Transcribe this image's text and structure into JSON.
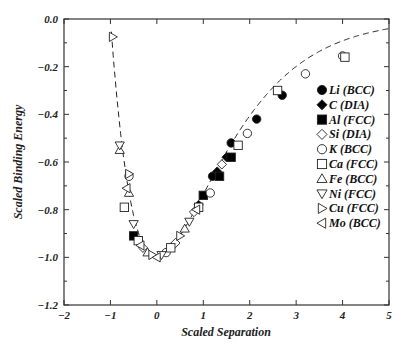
{
  "chart_data": {
    "type": "scatter",
    "title": "",
    "xlabel": "Scaled Separation",
    "ylabel": "Scaled Binding Energy",
    "xlim": [
      -2,
      5
    ],
    "ylim": [
      -1.2,
      0.0
    ],
    "xticks": [
      "-2",
      "-1",
      "0",
      "1",
      "2",
      "3",
      "4",
      "5"
    ],
    "yticks": [
      "0.0",
      "-0.2",
      "-0.4",
      "-0.6",
      "-0.8",
      "-1.0",
      "-1.2"
    ],
    "grid": false,
    "legend_position": "right-inside",
    "curve": {
      "name": "Universal binding energy relation",
      "style": "dashed",
      "formula": "E* = -(1 + a*) exp(-a*)"
    },
    "series": [
      {
        "name": "Li (BCC)",
        "marker": "filled-circle",
        "points": [
          [
            1.2,
            -0.66
          ],
          [
            1.6,
            -0.52
          ],
          [
            2.15,
            -0.42
          ],
          [
            2.7,
            -0.32
          ]
        ]
      },
      {
        "name": "C (DIA)",
        "marker": "filled-diamond",
        "points": [
          [
            0.9,
            -0.78
          ],
          [
            1.3,
            -0.64
          ],
          [
            1.5,
            -0.58
          ]
        ]
      },
      {
        "name": "Al (FCC)",
        "marker": "filled-square",
        "points": [
          [
            -0.5,
            -0.91
          ],
          [
            1.0,
            -0.74
          ],
          [
            1.35,
            -0.66
          ],
          [
            1.6,
            -0.58
          ]
        ]
      },
      {
        "name": "Si (DIA)",
        "marker": "open-diamond",
        "points": [
          [
            -0.3,
            -0.96
          ],
          [
            0.4,
            -0.94
          ],
          [
            0.8,
            -0.81
          ],
          [
            1.4,
            -0.61
          ]
        ]
      },
      {
        "name": "K (BCC)",
        "marker": "open-circle",
        "points": [
          [
            -0.6,
            -0.66
          ],
          [
            0.2,
            -0.98
          ],
          [
            1.15,
            -0.73
          ],
          [
            1.95,
            -0.48
          ],
          [
            3.2,
            -0.23
          ],
          [
            4.0,
            -0.155
          ]
        ]
      },
      {
        "name": "Ca (FCC)",
        "marker": "open-square",
        "points": [
          [
            -0.7,
            -0.79
          ],
          [
            -0.4,
            -0.93
          ],
          [
            0.3,
            -0.96
          ],
          [
            0.9,
            -0.79
          ],
          [
            1.75,
            -0.53
          ],
          [
            2.6,
            -0.3
          ],
          [
            4.05,
            -0.16
          ]
        ]
      },
      {
        "name": "Fe (BCC)",
        "marker": "open-triangle-up",
        "points": [
          [
            -0.8,
            -0.55
          ],
          [
            -0.6,
            -0.73
          ],
          [
            -0.2,
            -0.98
          ],
          [
            0.6,
            -0.88
          ]
        ]
      },
      {
        "name": "Ni (FCC)",
        "marker": "open-triangle-down",
        "points": [
          [
            -0.8,
            -0.53
          ],
          [
            -0.5,
            -0.86
          ],
          [
            0.1,
            -0.99
          ],
          [
            0.7,
            -0.85
          ]
        ]
      },
      {
        "name": "Cu (FCC)",
        "marker": "open-triangle-right",
        "points": [
          [
            -0.95,
            -0.075
          ],
          [
            -0.6,
            -0.65
          ],
          [
            -0.1,
            -0.99
          ],
          [
            0.5,
            -0.91
          ]
        ]
      },
      {
        "name": "Mo (BCC)",
        "marker": "open-triangle-left",
        "points": [
          [
            -0.65,
            -0.71
          ],
          [
            -0.35,
            -0.95
          ],
          [
            0.0,
            -1.0
          ],
          [
            0.85,
            -0.8
          ]
        ]
      }
    ]
  }
}
